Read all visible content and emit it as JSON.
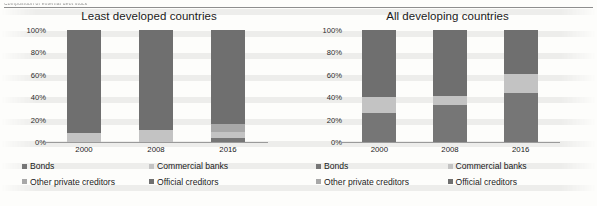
{
  "document": {
    "caption_fragment": "Composition of external debt stock"
  },
  "colors": {
    "bonds": "#767676",
    "commercial_banks": "#c3c3c3",
    "other_private_creditors": "#a8a8a8",
    "official_creditors": "#6f6f6f",
    "axis": "#9a9a9a",
    "text": "#1a1a1a",
    "page": "#fdfdfb"
  },
  "legend": {
    "items": [
      {
        "label": "Bonds",
        "color_key": "bonds"
      },
      {
        "label": "Commercial banks",
        "color_key": "commercial_banks"
      },
      {
        "label": "Other private creditors",
        "color_key": "other_private_creditors"
      },
      {
        "label": "Official creditors",
        "color_key": "official_creditors"
      }
    ]
  },
  "axis": {
    "y_ticks": [
      "0%",
      "20%",
      "40%",
      "60%",
      "80%",
      "100%"
    ],
    "y_values": [
      0,
      20,
      40,
      60,
      80,
      100
    ],
    "ylim": [
      0,
      100
    ]
  },
  "chart_data": [
    {
      "type": "bar",
      "stacked": true,
      "percent_stacked": true,
      "title": "Least developed countries",
      "xlabel": "",
      "ylabel": "",
      "ylim": [
        0,
        100
      ],
      "grid": false,
      "legend_position": "bottom",
      "categories": [
        "2000",
        "2008",
        "2016"
      ],
      "series": [
        {
          "name": "Bonds",
          "values": [
            0,
            0,
            4
          ]
        },
        {
          "name": "Commercial banks",
          "values": [
            8,
            11,
            5
          ]
        },
        {
          "name": "Other private creditors",
          "values": [
            0,
            0,
            7
          ]
        },
        {
          "name": "Official creditors",
          "values": [
            92,
            89,
            84
          ]
        }
      ]
    },
    {
      "type": "bar",
      "stacked": true,
      "percent_stacked": true,
      "title": "All developing countries",
      "xlabel": "",
      "ylabel": "",
      "ylim": [
        0,
        100
      ],
      "grid": false,
      "legend_position": "bottom",
      "categories": [
        "2000",
        "2008",
        "2016"
      ],
      "series": [
        {
          "name": "Bonds",
          "values": [
            26,
            33,
            44
          ]
        },
        {
          "name": "Commercial banks",
          "values": [
            14,
            8,
            17
          ]
        },
        {
          "name": "Other private creditors",
          "values": [
            0,
            0,
            0
          ]
        },
        {
          "name": "Official creditors",
          "values": [
            60,
            59,
            39
          ]
        }
      ]
    }
  ]
}
